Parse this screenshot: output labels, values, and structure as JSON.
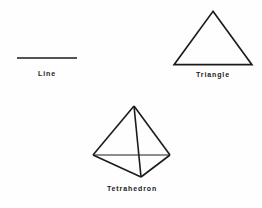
{
  "figure": {
    "background_color": "#fefefe",
    "stroke_color": "#1b1b1b",
    "label_color": "#1b1b1b"
  },
  "shapes": [
    {
      "id": "line",
      "label": "Line",
      "type": "line-segment",
      "stroke_width": 1.6,
      "geometry": {
        "x1": 1,
        "y1": 4,
        "x2": 61,
        "y2": 4
      }
    },
    {
      "id": "triangle",
      "label": "Triangle",
      "type": "triangle",
      "stroke_width": 1.6,
      "geometry": {
        "points": "40,2 78,54 2,54"
      }
    },
    {
      "id": "tetrahedron",
      "label": "Tetrahedron",
      "type": "tetrahedron-wireframe",
      "stroke_width": 1.6,
      "geometry": {
        "apex": "46,5",
        "left": "5,54",
        "right": "82,54",
        "front": "53,76",
        "edges": [
          {
            "name": "apex-left",
            "x1": 46,
            "y1": 5,
            "x2": 5,
            "y2": 54
          },
          {
            "name": "apex-right",
            "x1": 46,
            "y1": 5,
            "x2": 82,
            "y2": 54
          },
          {
            "name": "apex-front",
            "x1": 46,
            "y1": 5,
            "x2": 53,
            "y2": 76
          },
          {
            "name": "left-right",
            "x1": 5,
            "y1": 54,
            "x2": 82,
            "y2": 54
          },
          {
            "name": "left-front",
            "x1": 5,
            "y1": 54,
            "x2": 53,
            "y2": 76
          },
          {
            "name": "right-front",
            "x1": 82,
            "y1": 54,
            "x2": 53,
            "y2": 76
          }
        ]
      }
    }
  ]
}
